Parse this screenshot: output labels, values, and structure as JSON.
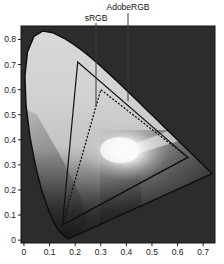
{
  "chart_data": {
    "type": "scatter",
    "title": "",
    "subtitle": "",
    "xlabel": "",
    "ylabel": "",
    "xlim": [
      -0.0115,
      0.7462
    ],
    "ylim": [
      -0.0115,
      0.8538
    ],
    "grid": false,
    "legend_position": "inline-callout",
    "background_color": "#2b2b2b",
    "page_background_color": "#ffffff",
    "axis_color": "#1a1a1a",
    "xticks": [
      0,
      0.1,
      0.2,
      0.3,
      0.4,
      0.5,
      0.6,
      0.7
    ],
    "xtick_labels": [
      "0",
      "0.1",
      "0.2",
      "0.3",
      "0.4",
      "0.5",
      "0.6",
      "0.7"
    ],
    "yticks": [
      0,
      0.1,
      0.2,
      0.3,
      0.4,
      0.5,
      0.6,
      0.7,
      0.8
    ],
    "ytick_labels": [
      "0",
      "0.1",
      "0.2",
      "0.3",
      "0.4",
      "0.5",
      "0.6",
      "0.7",
      "0.8"
    ],
    "annotations": [
      {
        "text": "sRGB",
        "points_to": [
          0.288,
          0.52
        ]
      },
      {
        "text": "AdobeRGB",
        "points_to": [
          0.41,
          0.545
        ]
      }
    ],
    "series": [
      {
        "name": "Spectral locus",
        "style": "solid-outline",
        "color": "#0d0d0d",
        "points": [
          [
            0.1741,
            0.005
          ],
          [
            0.174,
            0.005
          ],
          [
            0.1738,
            0.0049
          ],
          [
            0.1736,
            0.0049
          ],
          [
            0.1733,
            0.0048
          ],
          [
            0.173,
            0.0048
          ],
          [
            0.1726,
            0.0048
          ],
          [
            0.1721,
            0.0048
          ],
          [
            0.1714,
            0.0051
          ],
          [
            0.1703,
            0.0058
          ],
          [
            0.1689,
            0.0069
          ],
          [
            0.1669,
            0.0086
          ],
          [
            0.1644,
            0.0109
          ],
          [
            0.1611,
            0.0138
          ],
          [
            0.1566,
            0.0177
          ],
          [
            0.151,
            0.0227
          ],
          [
            0.144,
            0.0297
          ],
          [
            0.1355,
            0.0399
          ],
          [
            0.1241,
            0.0578
          ],
          [
            0.1096,
            0.0868
          ],
          [
            0.0913,
            0.1327
          ],
          [
            0.0687,
            0.2007
          ],
          [
            0.0454,
            0.295
          ],
          [
            0.0235,
            0.4127
          ],
          [
            0.0082,
            0.5384
          ],
          [
            0.0039,
            0.6548
          ],
          [
            0.0139,
            0.7502
          ],
          [
            0.0389,
            0.812
          ],
          [
            0.0743,
            0.8338
          ],
          [
            0.1142,
            0.8262
          ],
          [
            0.1547,
            0.8059
          ],
          [
            0.1929,
            0.7816
          ],
          [
            0.2296,
            0.7543
          ],
          [
            0.2658,
            0.7243
          ],
          [
            0.3016,
            0.6923
          ],
          [
            0.3373,
            0.6589
          ],
          [
            0.3731,
            0.6245
          ],
          [
            0.4087,
            0.5896
          ],
          [
            0.4441,
            0.5547
          ],
          [
            0.4788,
            0.5202
          ],
          [
            0.5125,
            0.4866
          ],
          [
            0.5448,
            0.4544
          ],
          [
            0.5752,
            0.4242
          ],
          [
            0.6029,
            0.3965
          ],
          [
            0.627,
            0.3725
          ],
          [
            0.6482,
            0.3514
          ],
          [
            0.6658,
            0.334
          ],
          [
            0.6801,
            0.3197
          ],
          [
            0.6915,
            0.3083
          ],
          [
            0.7006,
            0.2993
          ],
          [
            0.7079,
            0.292
          ],
          [
            0.714,
            0.2859
          ],
          [
            0.719,
            0.2809
          ],
          [
            0.723,
            0.277
          ],
          [
            0.726,
            0.274
          ],
          [
            0.7283,
            0.2717
          ],
          [
            0.73,
            0.27
          ],
          [
            0.7311,
            0.2689
          ],
          [
            0.732,
            0.268
          ],
          [
            0.7327,
            0.2673
          ],
          [
            0.7334,
            0.2666
          ],
          [
            0.734,
            0.266
          ],
          [
            0.7344,
            0.2656
          ],
          [
            0.7346,
            0.2654
          ],
          [
            0.7347,
            0.2653
          ]
        ]
      },
      {
        "name": "AdobeRGB",
        "style": "solid",
        "color": "#111111",
        "vertices": [
          [
            0.64,
            0.33
          ],
          [
            0.21,
            0.71
          ],
          [
            0.15,
            0.06
          ]
        ],
        "vertex_names": [
          "red",
          "green",
          "blue"
        ]
      },
      {
        "name": "sRGB",
        "style": "dashed",
        "color": "#111111",
        "vertices": [
          [
            0.64,
            0.33
          ],
          [
            0.3,
            0.6
          ],
          [
            0.15,
            0.06
          ]
        ],
        "vertex_names": [
          "red",
          "green",
          "blue"
        ]
      }
    ]
  },
  "labels": {
    "srgb": "sRGB",
    "adobergb": "AdobeRGB"
  },
  "axis": {
    "x_ticks": [
      "0",
      "0.1",
      "0.2",
      "0.3",
      "0.4",
      "0.5",
      "0.6",
      "0.7"
    ],
    "y_ticks": [
      "0",
      "0.1",
      "0.2",
      "0.3",
      "0.4",
      "0.5",
      "0.6",
      "0.7",
      "0.8"
    ]
  }
}
